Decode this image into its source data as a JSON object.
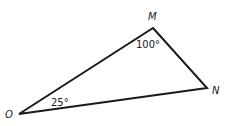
{
  "diagram": {
    "type": "triangle",
    "vertices": [
      {
        "name": "M",
        "x": 153,
        "y": 28
      },
      {
        "name": "N",
        "x": 207,
        "y": 88
      },
      {
        "name": "O",
        "x": 19,
        "y": 114
      }
    ],
    "labels": {
      "M": "M",
      "N": "N",
      "O": "O"
    },
    "angles": {
      "M": "100°",
      "O": "25°"
    },
    "stroke_color": "#1a1a1a"
  }
}
